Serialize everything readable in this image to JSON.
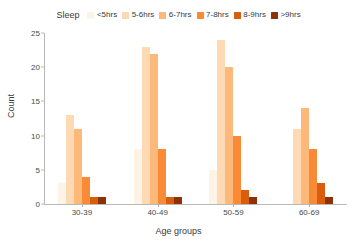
{
  "chart_data": {
    "type": "bar",
    "title": "",
    "xlabel": "Age groups",
    "ylabel": "Count",
    "categories": [
      "30-39",
      "40-49",
      "50-59",
      "60-69"
    ],
    "legend_title": "Sleep",
    "legend_position": "top-center",
    "grid": false,
    "ylim": [
      0,
      25
    ],
    "yticks": [
      0,
      5,
      10,
      15,
      20,
      25
    ],
    "series": [
      {
        "name": "<5hrs",
        "color": "#fdf3e7",
        "values": [
          3,
          8,
          5,
          0
        ]
      },
      {
        "name": "5-6hrs",
        "color": "#fdd9b4",
        "values": [
          13,
          23,
          24,
          11
        ]
      },
      {
        "name": "6-7hrs",
        "color": "#fdb97a",
        "values": [
          11,
          22,
          20,
          14
        ]
      },
      {
        "name": "7-8hrs",
        "color": "#f98a36",
        "values": [
          4,
          8,
          10,
          8
        ]
      },
      {
        "name": "8-9hrs",
        "color": "#d95d0c",
        "values": [
          1,
          1,
          2,
          3
        ]
      },
      {
        "name": ">9hrs",
        "color": "#8c3206",
        "values": [
          1,
          1,
          1,
          1
        ]
      }
    ]
  }
}
